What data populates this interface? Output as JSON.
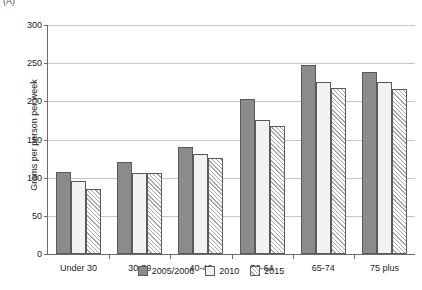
{
  "panel_letter": "(A)",
  "chart_data": {
    "type": "bar",
    "title": "",
    "xlabel": "",
    "ylabel": "Grams per person per week",
    "ylim": [
      0,
      300
    ],
    "yticks": [
      0,
      50,
      100,
      150,
      200,
      250,
      300
    ],
    "ytick_labels": [
      "0",
      "50",
      "100",
      "150",
      "200",
      "250",
      "300"
    ],
    "grid": true,
    "legend_position": "bottom",
    "categories": [
      "Under 30",
      "30-39",
      "40-49",
      "50-64",
      "65-74",
      "75 plus"
    ],
    "series": [
      {
        "name": "2005/2006",
        "fill": "solid-grey",
        "color": "#8b8b8b",
        "values": [
          107,
          121,
          140,
          203,
          247,
          239
        ]
      },
      {
        "name": "2010",
        "fill": "white",
        "color": "#f2f2f2",
        "values": [
          95,
          106,
          131,
          176,
          225,
          225
        ]
      },
      {
        "name": "2015",
        "fill": "diagonal-hatch",
        "color": "#ffffff",
        "values": [
          85,
          106,
          126,
          168,
          218,
          216
        ]
      }
    ]
  }
}
